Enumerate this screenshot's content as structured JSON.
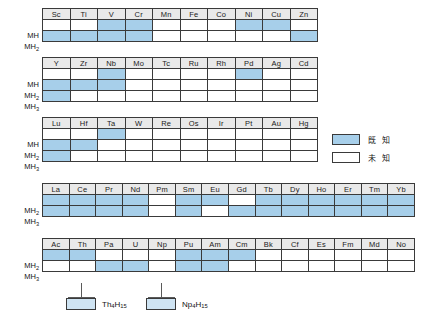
{
  "legend": {
    "items": [
      {
        "swatch": "known",
        "label": "既 知"
      },
      {
        "swatch": "unknown",
        "label": "未 知"
      }
    ]
  },
  "row_labels": {
    "mh": "MH",
    "mh2_main": "MH",
    "mh2_sub": "2",
    "mh3_main": "MH",
    "mh3_sub": "3"
  },
  "annotations": [
    {
      "name": "th4h15",
      "formula_main1": "Th",
      "formula_sub1": "4",
      "formula_main2": "H",
      "formula_sub2": "15"
    },
    {
      "name": "np4h15",
      "formula_main1": "Np",
      "formula_sub1": "4",
      "formula_main2": "H",
      "formula_sub2": "15"
    }
  ],
  "colors": {
    "known": "#a7cfea",
    "unknown": "#ffffff",
    "header_bg": "#e9e9e9",
    "border": "#3a3a3a"
  },
  "chart_data": {
    "type": "heatmap",
    "title": "",
    "xlabel": "",
    "ylabel": "",
    "legend_position": "right",
    "value_map": {
      "1": "known",
      "0": "unknown"
    },
    "tables": [
      {
        "id": "table-3d",
        "categories": [
          "Sc",
          "Ti",
          "V",
          "Cr",
          "Mn",
          "Fe",
          "Co",
          "Ni",
          "Cu",
          "Zn"
        ],
        "series": [
          {
            "name": "MH",
            "values": [
              0,
              0,
              1,
              1,
              0,
              0,
              0,
              1,
              1,
              0
            ]
          },
          {
            "name": "MH2",
            "values": [
              1,
              1,
              1,
              1,
              0,
              0,
              0,
              0,
              0,
              1
            ]
          }
        ]
      },
      {
        "id": "table-4d",
        "categories": [
          "Y",
          "Zr",
          "Nb",
          "Mo",
          "Tc",
          "Ru",
          "Rh",
          "Pd",
          "Ag",
          "Cd"
        ],
        "series": [
          {
            "name": "MH",
            "values": [
              0,
              0,
              1,
              0,
              0,
              0,
              0,
              1,
              0,
              0
            ]
          },
          {
            "name": "MH2",
            "values": [
              1,
              1,
              1,
              0,
              0,
              0,
              0,
              0,
              0,
              0
            ]
          },
          {
            "name": "MH3",
            "values": [
              1,
              0,
              0,
              0,
              0,
              0,
              0,
              0,
              0,
              0
            ]
          }
        ]
      },
      {
        "id": "table-5d",
        "categories": [
          "Lu",
          "Hf",
          "Ta",
          "W",
          "Re",
          "Os",
          "Ir",
          "Pt",
          "Au",
          "Hg"
        ],
        "series": [
          {
            "name": "MH",
            "values": [
              0,
              0,
              1,
              0,
              0,
              0,
              0,
              0,
              0,
              0
            ]
          },
          {
            "name": "MH2",
            "values": [
              1,
              1,
              0,
              0,
              0,
              0,
              0,
              0,
              0,
              0
            ]
          },
          {
            "name": "MH3",
            "values": [
              1,
              0,
              0,
              0,
              0,
              0,
              0,
              0,
              0,
              0
            ]
          }
        ]
      },
      {
        "id": "table-lanthanides",
        "categories": [
          "La",
          "Ce",
          "Pr",
          "Nd",
          "Pm",
          "Sm",
          "Eu",
          "Gd",
          "Tb",
          "Dy",
          "Ho",
          "Er",
          "Tm",
          "Yb"
        ],
        "series": [
          {
            "name": "MH2",
            "values": [
              1,
              1,
              1,
              1,
              0,
              1,
              1,
              0,
              1,
              1,
              1,
              1,
              1,
              1
            ]
          },
          {
            "name": "MH3",
            "values": [
              1,
              1,
              1,
              1,
              0,
              1,
              0,
              1,
              1,
              1,
              1,
              1,
              1,
              1
            ]
          }
        ]
      },
      {
        "id": "table-actinides",
        "categories": [
          "Ac",
          "Th",
          "Pa",
          "U",
          "Np",
          "Pu",
          "Am",
          "Cm",
          "Bk",
          "Cf",
          "Es",
          "Fm",
          "Md",
          "No"
        ],
        "series": [
          {
            "name": "MH2",
            "values": [
              1,
              1,
              0,
              0,
              0,
              1,
              1,
              1,
              0,
              0,
              0,
              0,
              0,
              0
            ]
          },
          {
            "name": "MH3",
            "values": [
              0,
              0,
              1,
              1,
              0,
              1,
              1,
              0,
              0,
              0,
              0,
              0,
              0,
              0
            ]
          }
        ]
      }
    ]
  }
}
